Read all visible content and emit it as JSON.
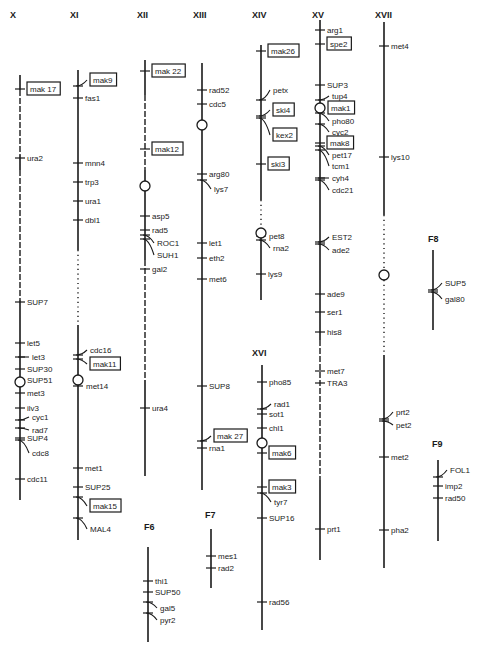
{
  "diagram": {
    "type": "genetic-linkage-map",
    "chromosomes": [
      {
        "id": "X",
        "label": "X",
        "x": 20,
        "labelX": 10,
        "labelY": 18,
        "segments": [
          [
            75,
            90,
            "line"
          ],
          [
            90,
            155,
            "dash"
          ],
          [
            155,
            170,
            "line"
          ],
          [
            170,
            300,
            "dash"
          ],
          [
            300,
            500,
            "line"
          ]
        ],
        "centromere": 382,
        "genes": [
          {
            "name": "mak 17",
            "y": 89,
            "box": true
          },
          {
            "name": "ura2",
            "y": 158
          },
          {
            "name": "SUP7",
            "y": 302
          },
          {
            "name": "let5",
            "y": 343
          },
          {
            "name": "let3",
            "y": 357,
            "lead": -1
          },
          {
            "name": "SUP30",
            "y": 369
          },
          {
            "name": "SUP51",
            "y": 380
          },
          {
            "name": "met3",
            "y": 393
          },
          {
            "name": "ilv3",
            "y": 408
          },
          {
            "name": "cyc1",
            "y": 420,
            "lead": -2,
            "ty": 417
          },
          {
            "name": "rad7",
            "y": 428,
            "lead": -1,
            "ty": 430
          },
          {
            "name": "SUP4",
            "y": 438
          },
          {
            "name": "cdc8",
            "y": 440,
            "lead": 2,
            "ty": 453
          },
          {
            "name": "cdc11",
            "y": 479
          }
        ]
      },
      {
        "id": "XI",
        "label": "XI",
        "x": 78,
        "labelX": 70,
        "labelY": 18,
        "segments": [
          [
            70,
            250,
            "line"
          ],
          [
            250,
            325,
            "dot"
          ],
          [
            325,
            540,
            "line"
          ]
        ],
        "centromere": 380,
        "genes": [
          {
            "name": "mak9",
            "y": 86,
            "box": true,
            "lead": -2,
            "ty": 80
          },
          {
            "name": "fas1",
            "y": 98
          },
          {
            "name": "mnn4",
            "y": 163
          },
          {
            "name": "trp3",
            "y": 182
          },
          {
            "name": "ura1",
            "y": 201
          },
          {
            "name": "dbl1",
            "y": 220
          },
          {
            "name": "cdc16",
            "y": 355,
            "lead": -1,
            "ty": 350
          },
          {
            "name": "mak11",
            "y": 359,
            "box": true,
            "lead": 2,
            "ty": 364
          },
          {
            "name": "met14",
            "y": 386,
            "tx": 8
          },
          {
            "name": "met1",
            "y": 468
          },
          {
            "name": "SUP25",
            "y": 487
          },
          {
            "name": "mak15",
            "y": 497,
            "box": true,
            "lead": 2,
            "ty": 506
          },
          {
            "name": "MAL4",
            "y": 518,
            "lead": 2,
            "ty": 529
          }
        ]
      },
      {
        "id": "XII",
        "label": "XII",
        "x": 145,
        "labelX": 137,
        "labelY": 18,
        "segments": [
          [
            60,
            95,
            "line"
          ],
          [
            95,
            170,
            "dash"
          ],
          [
            170,
            260,
            "line"
          ],
          [
            260,
            380,
            "dash"
          ],
          [
            380,
            476,
            "line"
          ]
        ],
        "centromere": 186,
        "genes": [
          {
            "name": "mak 22",
            "y": 71,
            "box": true
          },
          {
            "name": "mak12",
            "y": 149,
            "box": true
          },
          {
            "name": "asp5",
            "y": 216
          },
          {
            "name": "rad5",
            "y": 230
          },
          {
            "name": "ROC1",
            "y": 235,
            "lead": 3,
            "ty": 243
          },
          {
            "name": "SUH1",
            "y": 239,
            "lead": 3,
            "ty": 255
          },
          {
            "name": "gal2",
            "y": 269
          },
          {
            "name": "ura4",
            "y": 408
          }
        ]
      },
      {
        "id": "XIII",
        "label": "XIII",
        "x": 202,
        "labelX": 193,
        "labelY": 18,
        "segments": [
          [
            63,
            490,
            "line"
          ]
        ],
        "centromere": 125,
        "genes": [
          {
            "name": "rad52",
            "y": 90
          },
          {
            "name": "cdc5",
            "y": 104
          },
          {
            "name": "arg80",
            "y": 174
          },
          {
            "name": "lys7",
            "y": 180,
            "lead": 2,
            "ty": 189
          },
          {
            "name": "let1",
            "y": 243
          },
          {
            "name": "eth2",
            "y": 258
          },
          {
            "name": "met6",
            "y": 279
          },
          {
            "name": "SUP8",
            "y": 386
          },
          {
            "name": "mak 27",
            "y": 441,
            "box": true,
            "lead": -1,
            "ty": 436
          },
          {
            "name": "rna1",
            "y": 448
          }
        ]
      },
      {
        "id": "XIV",
        "label": "XIV",
        "x": 261,
        "labelX": 252,
        "labelY": 18,
        "segments": [
          [
            45,
            200,
            "line"
          ],
          [
            200,
            230,
            "dot"
          ],
          [
            230,
            300,
            "line"
          ]
        ],
        "centromere": 233,
        "genes": [
          {
            "name": "mak26",
            "y": 51,
            "box": true
          },
          {
            "name": "petx",
            "y": 100,
            "lead": -2,
            "ty": 90
          },
          {
            "name": "ski4",
            "y": 116,
            "box": true,
            "lead": -1,
            "ty": 110
          },
          {
            "name": "kex2",
            "y": 118,
            "box": true,
            "lead": 3,
            "ty": 135
          },
          {
            "name": "ski3",
            "y": 164,
            "box": true
          },
          {
            "name": "pet8",
            "y": 236,
            "tx": 8
          },
          {
            "name": "rna2",
            "y": 240,
            "lead": 2,
            "ty": 248
          },
          {
            "name": "lys9",
            "y": 274
          }
        ]
      },
      {
        "id": "XVI",
        "label": "XVI",
        "x": 262,
        "labelX": 252,
        "labelY": 356,
        "segments": [
          [
            365,
            630,
            "line"
          ]
        ],
        "centromere": 443,
        "genes": [
          {
            "name": "pho85",
            "y": 382
          },
          {
            "name": "rad1",
            "y": 409,
            "lead": -1,
            "ty": 404
          },
          {
            "name": "sot1",
            "y": 414
          },
          {
            "name": "chl1",
            "y": 428
          },
          {
            "name": "mak6",
            "y": 453,
            "box": true
          },
          {
            "name": "mak3",
            "y": 487,
            "box": true
          },
          {
            "name": "tyr7",
            "y": 493,
            "lead": 2,
            "ty": 502
          },
          {
            "name": "SUP16",
            "y": 518
          },
          {
            "name": "rad56",
            "y": 602
          }
        ]
      },
      {
        "id": "XV",
        "label": "XV",
        "x": 320,
        "labelX": 312,
        "labelY": 18,
        "segments": [
          [
            20,
            340,
            "line"
          ],
          [
            340,
            480,
            "dash"
          ],
          [
            480,
            560,
            "line"
          ]
        ],
        "centromere": 108,
        "genes": [
          {
            "name": "arg1",
            "y": 30
          },
          {
            "name": "spe2",
            "y": 44,
            "box": true
          },
          {
            "name": "SUP3",
            "y": 85
          },
          {
            "name": "tup4",
            "y": 100,
            "lead": -1,
            "ty": 96
          },
          {
            "name": "mak1",
            "y": 108,
            "box": true,
            "tx": 8
          },
          {
            "name": "pho80",
            "y": 113,
            "lead": 2,
            "ty": 121
          },
          {
            "name": "cyc2",
            "y": 124,
            "lead": 2,
            "ty": 132
          },
          {
            "name": "mak8",
            "y": 143,
            "box": true
          },
          {
            "name": "pet17",
            "y": 146,
            "lead": 2,
            "ty": 155
          },
          {
            "name": "tcm1",
            "y": 150,
            "lead": 3,
            "ty": 166
          },
          {
            "name": "cyh4",
            "y": 178,
            "lead": 1,
            "ty": 178
          },
          {
            "name": "cdc21",
            "y": 180,
            "lead": 2,
            "ty": 190
          },
          {
            "name": "EST2",
            "y": 242,
            "lead": -1,
            "ty": 237
          },
          {
            "name": "ade2",
            "y": 244,
            "lead": 2,
            "ty": 250
          },
          {
            "name": "ade9",
            "y": 294
          },
          {
            "name": "ser1",
            "y": 312
          },
          {
            "name": "his8",
            "y": 332
          },
          {
            "name": "met7",
            "y": 371
          },
          {
            "name": "TRA3",
            "y": 383
          },
          {
            "name": "prt1",
            "y": 529
          }
        ]
      },
      {
        "id": "XVII",
        "label": "XVII",
        "x": 384,
        "labelX": 375,
        "labelY": 18,
        "segments": [
          [
            22,
            215,
            "line"
          ],
          [
            215,
            270,
            "dot"
          ],
          [
            270,
            280,
            "line"
          ],
          [
            280,
            355,
            "dot"
          ],
          [
            355,
            568,
            "line"
          ]
        ],
        "centromere": 275,
        "genes": [
          {
            "name": "met4",
            "y": 46
          },
          {
            "name": "lys10",
            "y": 157
          },
          {
            "name": "prt2",
            "y": 419,
            "lead": -2,
            "ty": 412
          },
          {
            "name": "pet2",
            "y": 421,
            "lead": 2,
            "ty": 425
          },
          {
            "name": "met2",
            "y": 457
          },
          {
            "name": "pha2",
            "y": 530
          }
        ]
      },
      {
        "id": "F8",
        "label": "F8",
        "x": 433,
        "labelX": 428,
        "labelY": 242,
        "segments": [
          [
            250,
            330,
            "line"
          ]
        ],
        "genes": [
          {
            "name": "SUP5",
            "y": 290,
            "lead": -1,
            "ty": 283
          },
          {
            "name": "gal80",
            "y": 292,
            "lead": 2,
            "ty": 299
          }
        ]
      },
      {
        "id": "F9",
        "label": "F9",
        "x": 438,
        "labelX": 432,
        "labelY": 447,
        "segments": [
          [
            460,
            541,
            "line"
          ]
        ],
        "genes": [
          {
            "name": "FOL1",
            "y": 477,
            "lead": -1,
            "ty": 470
          },
          {
            "name": "imp2",
            "y": 486
          },
          {
            "name": "rad50",
            "y": 498
          }
        ]
      },
      {
        "id": "F6",
        "label": "F6",
        "x": 148,
        "labelX": 144,
        "labelY": 530,
        "segments": [
          [
            547,
            642,
            "line"
          ]
        ],
        "genes": [
          {
            "name": "thi1",
            "y": 581
          },
          {
            "name": "SUP50",
            "y": 592
          },
          {
            "name": "gal5",
            "y": 602,
            "lead": 2,
            "ty": 608
          },
          {
            "name": "pyr2",
            "y": 613,
            "lead": 2,
            "ty": 620
          }
        ]
      },
      {
        "id": "F7",
        "label": "F7",
        "x": 211,
        "labelX": 205,
        "labelY": 518,
        "segments": [
          [
            529,
            588,
            "line"
          ]
        ],
        "genes": [
          {
            "name": "mes1",
            "y": 556
          },
          {
            "name": "rad2",
            "y": 568
          }
        ]
      }
    ]
  }
}
